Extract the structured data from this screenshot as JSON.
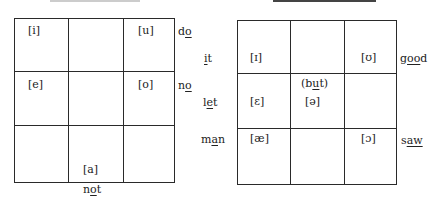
{
  "left_chart": {
    "symbols": {
      "i": "[i]",
      "u": "[u]",
      "e": "[e]",
      "o": "[o]",
      "a": "[a]"
    },
    "words": {
      "do": {
        "pre": "d",
        "u": "o",
        "post": ""
      },
      "no": {
        "pre": "n",
        "u": "o",
        "post": ""
      },
      "not": {
        "pre": "n",
        "u": "o",
        "post": "t"
      }
    }
  },
  "right_chart": {
    "symbols": {
      "I": "[ɪ]",
      "U": "[ʊ]",
      "E": "[ɛ]",
      "schwa": "[ə]",
      "ae": "[æ]",
      "open_o": "[ɔ]"
    },
    "but_label": {
      "pre": "(b",
      "u": "u",
      "post": "t)"
    },
    "words": {
      "it": {
        "pre": "",
        "u": "i",
        "post": "t"
      },
      "let": {
        "pre": "l",
        "u": "e",
        "post": "t"
      },
      "man": {
        "pre": "m",
        "u": "a",
        "post": "n"
      },
      "good": {
        "pre": "g",
        "u": "oo",
        "post": "d"
      },
      "saw": {
        "pre": "s",
        "u": "aw",
        "post": ""
      }
    }
  }
}
